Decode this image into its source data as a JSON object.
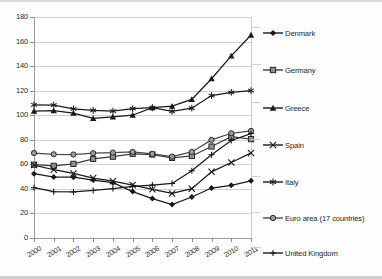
{
  "chart_data": {
    "type": "line",
    "title": "",
    "subtitle": "",
    "xlabel": "",
    "ylabel": "",
    "x": [
      2000,
      2001,
      2002,
      2003,
      2004,
      2005,
      2006,
      2007,
      2008,
      2009,
      2010,
      2011
    ],
    "xtick_labels": [
      "2000",
      "2001",
      "2002",
      "2003",
      "2004",
      "2005",
      "2006",
      "2007",
      "2008",
      "2009",
      "2010",
      "2011"
    ],
    "ytick_labels": [
      "0",
      "20",
      "40",
      "60",
      "80",
      "100",
      "120",
      "140",
      "160",
      "180"
    ],
    "yticks": [
      0,
      20,
      40,
      60,
      80,
      100,
      120,
      140,
      160,
      180
    ],
    "ylim": [
      0,
      180
    ],
    "grid": "horizontal",
    "legend_position": "right",
    "series": [
      {
        "name": "Denmark",
        "marker": "diamond",
        "color": "#1a1a1a",
        "values": [
          52.4,
          49.6,
          49.5,
          47.2,
          45.1,
          37.8,
          32.1,
          27.3,
          33.4,
          40.7,
          42.9,
          46.6
        ]
      },
      {
        "name": "Germany",
        "marker": "square",
        "color": "#3d3d3d",
        "values": [
          59.7,
          58.8,
          60.4,
          64.4,
          66.2,
          68.5,
          68.0,
          65.2,
          66.8,
          74.5,
          82.5,
          80.5
        ]
      },
      {
        "name": "Greece",
        "marker": "triangle",
        "color": "#1a1a1a",
        "values": [
          103.4,
          103.7,
          101.7,
          97.4,
          98.6,
          100.0,
          106.1,
          107.4,
          112.9,
          129.7,
          148.3,
          165.3
        ]
      },
      {
        "name": "Spain",
        "marker": "cross",
        "color": "#1a1a1a",
        "values": [
          59.4,
          55.6,
          52.6,
          48.8,
          46.3,
          43.1,
          39.6,
          36.3,
          40.2,
          53.9,
          61.5,
          69.3
        ]
      },
      {
        "name": "Italy",
        "marker": "star",
        "color": "#1a1a1a",
        "values": [
          108.5,
          108.2,
          105.1,
          103.9,
          103.4,
          105.4,
          106.1,
          103.1,
          105.7,
          116.0,
          118.6,
          120.1
        ]
      },
      {
        "name": "Euro area (17 countries)",
        "marker": "circle",
        "color": "#4a4a4a",
        "values": [
          69.2,
          68.2,
          68.0,
          69.1,
          69.6,
          70.1,
          68.5,
          66.3,
          70.1,
          79.9,
          85.3,
          87.2
        ]
      },
      {
        "name": "United Kingdom",
        "marker": "plus",
        "color": "#1a1a1a",
        "values": [
          41.0,
          37.7,
          37.5,
          38.7,
          40.3,
          42.1,
          43.1,
          44.4,
          54.8,
          67.8,
          79.4,
          85.0
        ]
      }
    ]
  },
  "legend": {
    "items": [
      {
        "label": "Denmark",
        "marker": "diamond"
      },
      {
        "label": "Germany",
        "marker": "square"
      },
      {
        "label": "Greece",
        "marker": "triangle"
      },
      {
        "label": "Spain",
        "marker": "cross"
      },
      {
        "label": "Italy",
        "marker": "star"
      },
      {
        "label": "Euro area (17 countries)",
        "marker": "circle"
      },
      {
        "label": "United Kingdom",
        "marker": "plus"
      }
    ]
  },
  "colors": {
    "axis": "#9a9a9a",
    "grid": "#d0d0d0",
    "text": "#1d1d1d",
    "line": "#1a1a1a",
    "marker_fill_grey": "#8a8a8a"
  }
}
